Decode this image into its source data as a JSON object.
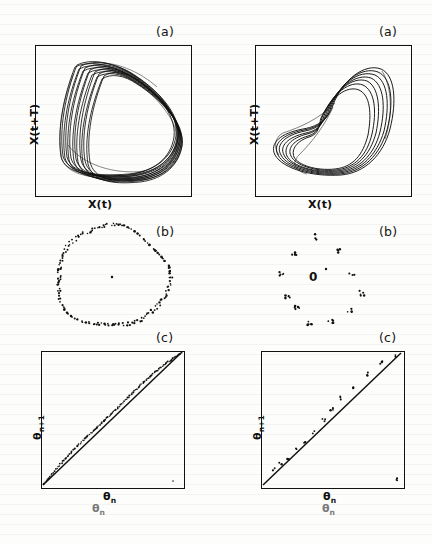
{
  "figure": {
    "ink_color": "#111111",
    "background_color": "#fdfdfc"
  },
  "columns": [
    {
      "id": "left",
      "regime": "quasiperiodic",
      "panels": [
        {
          "key": "a",
          "label": "(a)",
          "xlabel": "X(t)",
          "ylabel_base": "X(t+",
          "ylabel_tau": "T)",
          "ylabel": "X(t+T)",
          "type": "phase-portrait"
        },
        {
          "key": "b",
          "label": "(b)",
          "type": "poincare-section",
          "center_marker": ""
        },
        {
          "key": "c",
          "label": "(c)",
          "xlabel_base": "θ",
          "xlabel_sub": "n",
          "ylabel_base": "θ",
          "ylabel_sub": "n+1",
          "type": "circle-map"
        }
      ]
    },
    {
      "id": "right",
      "regime": "phase-locked",
      "panels": [
        {
          "key": "a",
          "label": "(a)",
          "xlabel": "X(t)",
          "ylabel_base": "X(t+",
          "ylabel_tau": "T)",
          "ylabel": "X(t+T)",
          "type": "phase-portrait"
        },
        {
          "key": "b",
          "label": "(b)",
          "type": "poincare-section",
          "center_marker": "0"
        },
        {
          "key": "c",
          "label": "(c)",
          "xlabel_base": "θ",
          "xlabel_sub": "n",
          "ylabel_base": "θ",
          "ylabel_sub": "n+1",
          "type": "circle-map"
        }
      ]
    }
  ],
  "bottom_labels": [
    {
      "base": "θ",
      "sub": "n"
    },
    {
      "base": "θ",
      "sub": "n"
    }
  ],
  "chart_data": [
    {
      "type": "line",
      "panel": "left-a",
      "title": "(a)",
      "xlabel": "X(t)",
      "ylabel": "X(t+T)",
      "grid": false,
      "legend": false,
      "xlim": [
        0,
        1
      ],
      "ylim": [
        0,
        1
      ],
      "series_count": 14,
      "shape": "rounded-triangular torus band",
      "note": "Dense quasi-periodic trajectory bundle filling a torus band"
    },
    {
      "type": "line",
      "panel": "right-a",
      "title": "(a)",
      "xlabel": "X(t)",
      "ylabel": "X(t+T)",
      "grid": false,
      "legend": false,
      "xlim": [
        0,
        1
      ],
      "ylim": [
        0,
        1
      ],
      "series_count": 7,
      "shape": "crescent / comma-shaped nested loops",
      "note": "Discrete phase-locked periodic orbit, resolvable loops"
    },
    {
      "type": "scatter",
      "panel": "left-b",
      "title": "(b)",
      "grid": false,
      "legend": false,
      "n_points": 180,
      "shape": "closed ring",
      "center_point": [
        0.5,
        0.5
      ],
      "note": "Poincare section of a torus: continuous invariant circle"
    },
    {
      "type": "scatter",
      "panel": "right-b",
      "title": "(b)",
      "grid": false,
      "legend": false,
      "n_clusters": 11,
      "cluster_centers": [
        [
          0.4,
          0.1
        ],
        [
          0.3,
          0.24
        ],
        [
          0.23,
          0.34
        ],
        [
          0.18,
          0.52
        ],
        [
          0.28,
          0.7
        ],
        [
          0.45,
          0.84
        ],
        [
          0.62,
          0.72
        ],
        [
          0.72,
          0.54
        ],
        [
          0.8,
          0.36
        ],
        [
          0.7,
          0.22
        ],
        [
          0.56,
          0.12
        ]
      ],
      "annotation": "0",
      "annotation_pos": [
        0.47,
        0.5
      ],
      "note": "Poincare section of a phase-locked orbit: discrete point clusters"
    },
    {
      "type": "scatter",
      "panel": "left-c",
      "title": "(c)",
      "xlabel": "θn",
      "ylabel": "θn+1",
      "grid": false,
      "legend": false,
      "xlim": [
        0,
        1
      ],
      "ylim": [
        0,
        1
      ],
      "reference_line": "y = x",
      "n_points": 120,
      "note": "Circle map: continuous dotted curve lying just above the diagonal"
    },
    {
      "type": "scatter",
      "panel": "right-c",
      "title": "(c)",
      "xlabel": "θn",
      "ylabel": "θn+1",
      "grid": false,
      "legend": false,
      "xlim": [
        0,
        1
      ],
      "ylim": [
        0,
        1
      ],
      "reference_line": "y = x",
      "n_points": 14,
      "points": [
        [
          0.08,
          0.12
        ],
        [
          0.13,
          0.17
        ],
        [
          0.18,
          0.2
        ],
        [
          0.24,
          0.27
        ],
        [
          0.3,
          0.33
        ],
        [
          0.37,
          0.4
        ],
        [
          0.44,
          0.49
        ],
        [
          0.5,
          0.57
        ],
        [
          0.57,
          0.66
        ],
        [
          0.66,
          0.74
        ],
        [
          0.75,
          0.84
        ],
        [
          0.86,
          0.93
        ],
        [
          0.95,
          0.98
        ],
        [
          0.97,
          0.04
        ]
      ],
      "note": "Circle map: only a few discrete points near the diagonal"
    }
  ]
}
